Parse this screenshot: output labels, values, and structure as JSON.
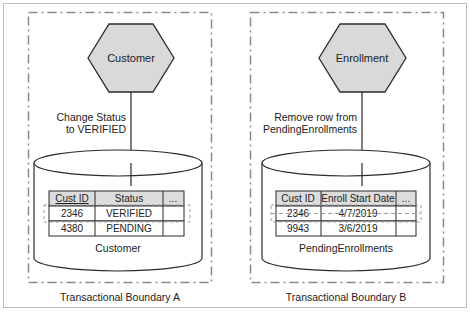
{
  "colors": {
    "frame": "#bdbdbd",
    "dashed_boundary": "#8a8a8a",
    "hexagon_fill": "#d9d9d9",
    "stroke": "#2b2b2b",
    "table_header_fill": "#dcdcdc",
    "table_row_fill": "#ffffff",
    "highlight_dash": "#9a9a9a"
  },
  "panels": [
    {
      "boundary_label": "Transactional Boundary A",
      "service": "Customer",
      "operation_line1": "Change Status",
      "operation_line2": "to VERIFIED",
      "database_label": "Customer",
      "table": {
        "headers": [
          "Cust ID",
          "Status",
          "..."
        ],
        "rows": [
          [
            "2346",
            "VERIFIED",
            ""
          ],
          [
            "4380",
            "PENDING",
            ""
          ]
        ],
        "highlighted_row": 0
      }
    },
    {
      "boundary_label": "Transactional Boundary B",
      "service": "Enrollment",
      "operation_line1": "Remove row from",
      "operation_line2": "PendingEnrollments",
      "database_label": "PendingEnrollments",
      "table": {
        "headers": [
          "Cust ID",
          "Enroll Start Date",
          "..."
        ],
        "rows": [
          [
            "2346",
            "4/7/2019",
            ""
          ],
          [
            "9943",
            "3/6/2019",
            ""
          ]
        ],
        "highlighted_row": 0
      }
    }
  ]
}
